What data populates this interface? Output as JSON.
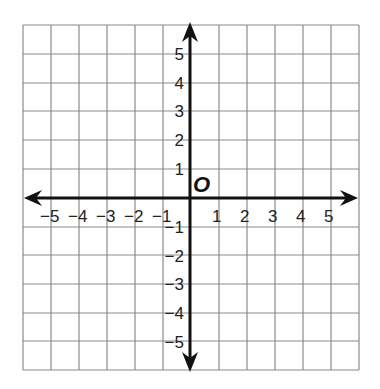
{
  "diagram": {
    "type": "coordinate-plane",
    "origin_label": "O",
    "x_ticks": [
      "−5",
      "−4",
      "−3",
      "−2",
      "−1",
      "1",
      "2",
      "3",
      "4",
      "5"
    ],
    "y_ticks": [
      "5",
      "4",
      "3",
      "2",
      "1",
      "−1",
      "−2",
      "−3",
      "−4",
      "−5"
    ],
    "x_range": [
      -5,
      5
    ],
    "y_range": [
      -5,
      5
    ],
    "grid_columns": 12,
    "grid_rows": 12,
    "colors": {
      "grid": "#8a8a8a",
      "axis": "#111111",
      "background": "#ffffff"
    }
  }
}
